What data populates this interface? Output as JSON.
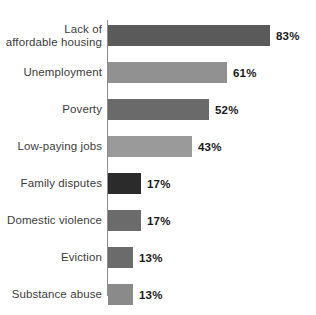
{
  "chart_data": {
    "type": "bar",
    "orientation": "horizontal",
    "title": "",
    "subtitle": "",
    "xlabel": "",
    "ylabel": "",
    "xlim": [
      0,
      100
    ],
    "grid": false,
    "legend": "none",
    "unit": "%",
    "categories": [
      "Lack of\naffordable housing",
      "Unemployment",
      "Poverty",
      "Low-paying jobs",
      "Family disputes",
      "Domestic violence",
      "Eviction",
      "Substance abuse"
    ],
    "values": [
      83,
      61,
      52,
      43,
      17,
      17,
      13,
      13
    ],
    "data_labels": [
      "83%",
      "61%",
      "52%",
      "43%",
      "17%",
      "17%",
      "13%",
      "13%"
    ],
    "bar_colors": [
      "#5a5a5a",
      "#919191",
      "#6a6a6a",
      "#9a9a9a",
      "#2b2b2b",
      "#6b6b6b",
      "#6b6b6b",
      "#8a8a8a"
    ],
    "axis_color": "#8e8e8e",
    "label_color": "#3c3c3c",
    "value_color": "#1a1a1a",
    "background": "#ffffff"
  },
  "layout": {
    "axis_x": 108,
    "bar_height": 21,
    "row_pitch": 37,
    "first_row_top": 25,
    "px_per_unit": 1.95,
    "value_gap": 6
  }
}
